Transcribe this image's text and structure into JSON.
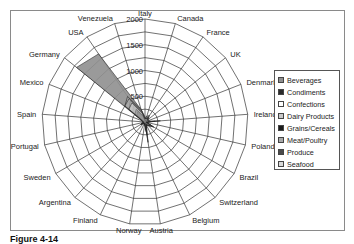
{
  "chart_data": {
    "type": "radar",
    "title": "",
    "categories": [
      "Italy",
      "Canada",
      "France",
      "UK",
      "Denmark",
      "Ireland",
      "Poland",
      "Brazil",
      "Switzerland",
      "Belgium",
      "Austria",
      "Norway",
      "Finland",
      "Argentina",
      "Sweden",
      "Portugal",
      "Spain",
      "Mexico",
      "Germany",
      "USA",
      "Venezuela"
    ],
    "radial_ticks": [
      500,
      1000,
      1500,
      2000
    ],
    "rlim": [
      0,
      2000
    ],
    "legend_position": "right",
    "series": [
      {
        "name": "Beverages",
        "color": "#8f8f8f",
        "values": [
          60,
          120,
          150,
          80,
          60,
          60,
          40,
          200,
          100,
          60,
          220,
          30,
          40,
          30,
          100,
          40,
          50,
          60,
          1700,
          1600,
          250
        ]
      },
      {
        "name": "Condiments",
        "color": "#2b2b2b",
        "values": [
          40,
          60,
          80,
          40,
          30,
          300,
          20,
          120,
          60,
          40,
          150,
          20,
          30,
          20,
          60,
          20,
          30,
          40,
          300,
          400,
          150
        ]
      },
      {
        "name": "Confections",
        "color": "#ffffff",
        "values": [
          80,
          40,
          100,
          60,
          50,
          80,
          30,
          150,
          80,
          50,
          200,
          20,
          40,
          20,
          70,
          30,
          40,
          50,
          400,
          500,
          200
        ]
      },
      {
        "name": "Dairy Products",
        "color": "#c8c8c8",
        "values": [
          100,
          60,
          120,
          70,
          80,
          100,
          30,
          180,
          90,
          60,
          250,
          30,
          50,
          30,
          90,
          30,
          50,
          60,
          500,
          600,
          250
        ]
      },
      {
        "name": "Grains/Cereals",
        "color": "#1a1a1a",
        "values": [
          30,
          30,
          60,
          30,
          20,
          40,
          10,
          80,
          40,
          20,
          100,
          10,
          20,
          10,
          40,
          10,
          20,
          30,
          200,
          250,
          100
        ]
      },
      {
        "name": "Meat/Poultry",
        "color": "#a9a9a9",
        "values": [
          50,
          80,
          90,
          50,
          40,
          200,
          20,
          120,
          70,
          60,
          400,
          20,
          30,
          20,
          50,
          20,
          30,
          40,
          500,
          550,
          220
        ]
      },
      {
        "name": "Produce",
        "color": "#4a4a4a",
        "values": [
          20,
          30,
          40,
          30,
          20,
          50,
          10,
          60,
          30,
          20,
          120,
          10,
          20,
          10,
          30,
          10,
          20,
          20,
          250,
          300,
          120
        ]
      },
      {
        "name": "Seafood",
        "color": "#d9d9d9",
        "values": [
          60,
          70,
          80,
          60,
          60,
          80,
          20,
          120,
          80,
          40,
          200,
          20,
          40,
          30,
          80,
          20,
          40,
          50,
          400,
          450,
          180
        ]
      }
    ]
  },
  "legend": {
    "items": [
      {
        "label": "Beverages",
        "color": "#8f8f8f"
      },
      {
        "label": "Condiments",
        "color": "#2b2b2b"
      },
      {
        "label": "Confections",
        "color": "#ffffff"
      },
      {
        "label": "Dairy Products",
        "color": "#c8c8c8"
      },
      {
        "label": "Grains/Cereals",
        "color": "#1a1a1a"
      },
      {
        "label": "Meat/Poultry",
        "color": "#a9a9a9"
      },
      {
        "label": "Produce",
        "color": "#4a4a4a"
      },
      {
        "label": "Seafood",
        "color": "#d9d9d9"
      }
    ]
  },
  "caption": {
    "bold": "Figure 4-14",
    "rest": ""
  }
}
